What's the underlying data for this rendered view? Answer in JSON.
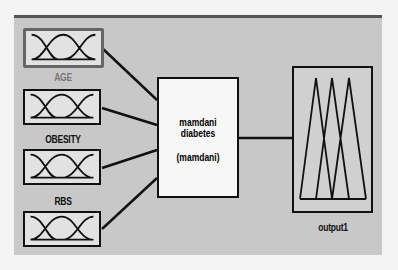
{
  "diagram": {
    "type": "fuzzy-inference-system",
    "inputs": [
      {
        "name": "AGE",
        "selected": true
      },
      {
        "name": "OBESITY",
        "selected": false
      },
      {
        "name": "RBS",
        "selected": false
      },
      {
        "name": "",
        "selected": false
      }
    ],
    "system": {
      "name": "mamdani diabetes",
      "type": "(mamdani)"
    },
    "output": {
      "name": "output1"
    },
    "colors": {
      "panel": "#c8c8c8",
      "box_fill": "#e2e2e2",
      "selected_border": "#666666",
      "line": "#111111"
    }
  }
}
